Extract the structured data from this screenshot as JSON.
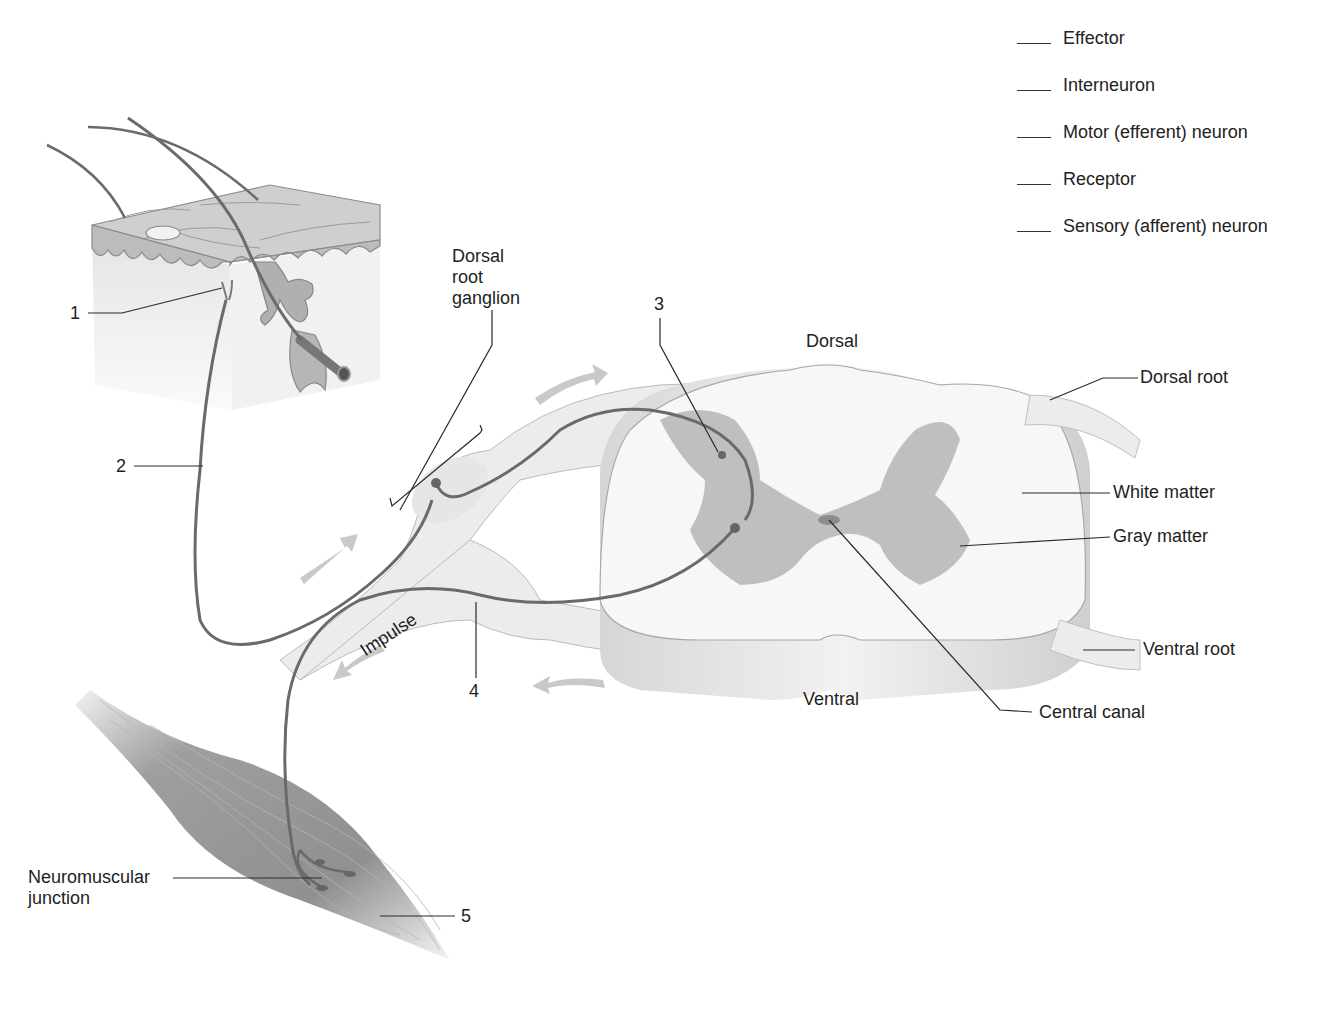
{
  "diagram": {
    "key_list": [
      {
        "blank": "___",
        "label": "Effector"
      },
      {
        "blank": "___",
        "label": "Interneuron"
      },
      {
        "blank": "___",
        "label": "Motor (efferent) neuron"
      },
      {
        "blank": "___",
        "label": "Receptor"
      },
      {
        "blank": "___",
        "label": "Sensory (afferent) neuron"
      }
    ],
    "numbered_callouts": [
      "1",
      "2",
      "3",
      "4",
      "5"
    ],
    "anatomy_labels": {
      "dorsal_root_ganglion_line1": "Dorsal",
      "dorsal_root_ganglion_line2": "root",
      "dorsal_root_ganglion_line3": "ganglion",
      "dorsal": "Dorsal",
      "ventral": "Ventral",
      "dorsal_root": "Dorsal root",
      "white_matter": "White matter",
      "gray_matter": "Gray matter",
      "ventral_root": "Ventral root",
      "central_canal": "Central canal",
      "neuromuscular_line1": "Neuromuscular",
      "neuromuscular_line2": "junction",
      "impulse": "Impulse"
    },
    "colors": {
      "nerve_fill": "#ececec",
      "gray_matter": "#bdbdbd",
      "neuron_line": "#6a6a6a",
      "arrow": "#c9c9c9",
      "label_text": "#1e1e1e"
    }
  }
}
